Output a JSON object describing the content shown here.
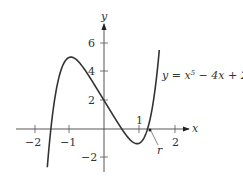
{
  "chart_data": {
    "type": "line",
    "title": "",
    "xlabel": "x",
    "ylabel": "y",
    "xlim": [
      -2.5,
      2.5
    ],
    "ylim": [
      -3,
      7
    ],
    "x_ticks": [
      -2,
      -1,
      1,
      2
    ],
    "y_ticks": [
      -2,
      2,
      4,
      6
    ],
    "x_tick_labels": [
      "−2",
      "−1",
      "1",
      "2"
    ],
    "y_tick_labels": [
      "−2",
      "2",
      "4",
      "6"
    ],
    "series": [
      {
        "name": "y = x^5 − 4x + 2",
        "equation": "x^5 - 4x + 2",
        "x_range": [
          -1.62,
          1.58
        ]
      }
    ],
    "annotations": [
      {
        "text": "y = x⁵ − 4x + 2",
        "position": "right of curve"
      },
      {
        "text": "r",
        "points_to": "root near x≈1.24"
      }
    ],
    "grid": false,
    "legend": "none"
  },
  "labels": {
    "x_axis": "x",
    "y_axis": "y",
    "equation_prefix": "y = x",
    "equation_exp": "5",
    "equation_suffix": " − 4x + 2",
    "root": "r",
    "xt_m2": "−2",
    "xt_m1": "−1",
    "xt_1": "1",
    "xt_2": "2",
    "yt_6": "6",
    "yt_4": "4",
    "yt_2": "2",
    "yt_m2": "−2"
  }
}
